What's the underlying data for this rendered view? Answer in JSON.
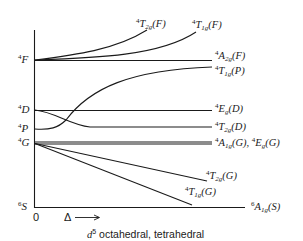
{
  "diagram": {
    "type": "energy-level-correlation-diagram",
    "caption": {
      "ion": "d",
      "superscript": "5",
      "text": " octahedral, tetrahedral"
    },
    "x_axis": {
      "origin_label": "0",
      "variable_label": "Δ",
      "arrow": "⟶"
    },
    "free_ion_terms": [
      {
        "mult": "4",
        "L": "F"
      },
      {
        "mult": "4",
        "L": "D"
      },
      {
        "mult": "4",
        "L": "P"
      },
      {
        "mult": "4",
        "L": "G"
      },
      {
        "mult": "6",
        "L": "S"
      }
    ],
    "states": [
      {
        "mult": "4",
        "sym": "T",
        "sub": "2g",
        "parent": "(F)"
      },
      {
        "mult": "4",
        "sym": "T",
        "sub": "1g",
        "parent": "(F)"
      },
      {
        "mult": "4",
        "sym": "A",
        "sub": "2g",
        "parent": "(F)"
      },
      {
        "mult": "4",
        "sym": "T",
        "sub": "1g",
        "parent": "(P)"
      },
      {
        "mult": "4",
        "sym": "E",
        "sub": "g",
        "parent": "(D)"
      },
      {
        "mult": "4",
        "sym": "T",
        "sub": "2g",
        "parent": "(D)"
      },
      {
        "mult": "4",
        "sym": "A",
        "sub": "1g",
        "parent": "(G), ",
        "mult2": "4",
        "sym2": "E",
        "sub2": "g",
        "parent2": "(G)"
      },
      {
        "mult": "4",
        "sym": "T",
        "sub": "2g",
        "parent": "(G)"
      },
      {
        "mult": "4",
        "sym": "T",
        "sub": "1g",
        "parent": "(G)"
      },
      {
        "mult": "6",
        "sym": "A",
        "sub": "1g",
        "parent": "(S)"
      }
    ],
    "colors": {
      "line": "#1a1a1a",
      "background": "#ffffff"
    }
  }
}
